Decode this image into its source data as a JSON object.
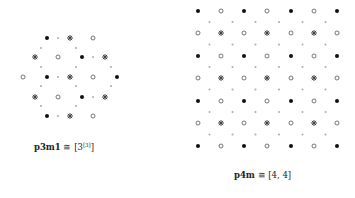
{
  "figures": [
    {
      "name": "p3m1",
      "symbol": "p3m1",
      "relation": " ≅ [3",
      "superscript": "[3]",
      "closing": "]",
      "label_pos": [
        34,
        142
      ],
      "points": {
        "filled": [
          [
            47,
            38
          ],
          [
            82,
            57
          ],
          [
            47,
            77
          ],
          [
            117,
            77
          ],
          [
            82,
            97
          ],
          [
            47,
            116
          ]
        ],
        "open": [
          [
            93,
            38
          ],
          [
            58,
            57
          ],
          [
            23,
            77
          ],
          [
            93,
            77
          ],
          [
            58,
            97
          ],
          [
            93,
            116
          ]
        ],
        "star": [
          [
            70,
            38
          ],
          [
            35,
            57
          ],
          [
            105,
            57
          ],
          [
            70,
            77
          ],
          [
            35,
            97
          ],
          [
            105,
            97
          ],
          [
            70,
            116
          ]
        ],
        "gray": [
          [
            58,
            38
          ],
          [
            41,
            48
          ],
          [
            76,
            48
          ],
          [
            93,
            57
          ],
          [
            41,
            67
          ],
          [
            76,
            67
          ],
          [
            111,
            67
          ],
          [
            58,
            77
          ],
          [
            41,
            86
          ],
          [
            76,
            86
          ],
          [
            111,
            86
          ],
          [
            93,
            97
          ],
          [
            41,
            106
          ],
          [
            76,
            106
          ],
          [
            58,
            116
          ]
        ]
      }
    },
    {
      "name": "p4m",
      "symbol": "p4m",
      "relation": " ≅ [4, 4]",
      "superscript": "",
      "closing": "",
      "label_pos": [
        234,
        170
      ],
      "grid": {
        "xs": [
          198,
          221,
          244,
          267,
          291,
          314,
          337
        ],
        "ys": [
          11,
          33,
          56,
          78,
          101,
          123,
          146
        ]
      }
    }
  ],
  "colors": {
    "filled": "#111111",
    "open": "#555555",
    "star": "#444444",
    "gray": "#aaaaaa"
  }
}
